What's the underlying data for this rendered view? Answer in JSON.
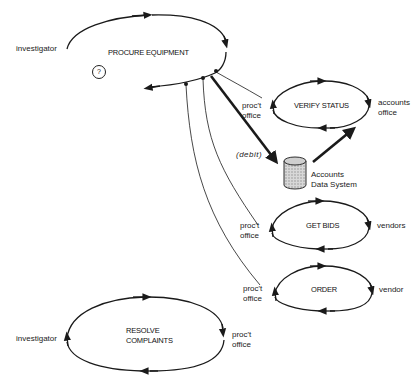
{
  "diagram": {
    "stroke_color": "#1a1a1a",
    "background": "#ffffff",
    "loops": [
      {
        "id": "procure",
        "title": "PROCURE EQUIPMENT",
        "left_role": "investigator",
        "right_role": ""
      },
      {
        "id": "verify",
        "title": "VERIFY STATUS",
        "left_role": "proc't\noffice",
        "right_role": "accounts\noffice"
      },
      {
        "id": "bids",
        "title": "GET BIDS",
        "left_role": "proc't\noffice",
        "right_role": "vendors"
      },
      {
        "id": "order",
        "title": "ORDER",
        "left_role": "proc't\noffice",
        "right_role": "vendor"
      },
      {
        "id": "resolve",
        "title": "RESOLVE\nCOMPLAINTS",
        "left_role": "investigator",
        "right_role": "proc't\noffice"
      }
    ],
    "procure": {
      "title": "PROCURE EQUIPMENT",
      "left_role": "investigator",
      "question_mark": "?"
    },
    "verify": {
      "title": "VERIFY STATUS",
      "left_role_1": "proc't",
      "left_role_2": "office",
      "right_role_1": "accounts",
      "right_role_2": "office"
    },
    "bids": {
      "title": "GET BIDS",
      "left_role_1": "proc't",
      "left_role_2": "office",
      "right_role": "vendors"
    },
    "order": {
      "title": "ORDER",
      "left_role_1": "proc't",
      "left_role_2": "office",
      "right_role": "vendor"
    },
    "resolve": {
      "title_1": "RESOLVE",
      "title_2": "COMPLAINTS",
      "left_role": "investigator",
      "right_role_1": "proc't",
      "right_role_2": "office"
    },
    "database": {
      "label_1": "Accounts",
      "label_2": "Data System",
      "icon": "database-cylinder-icon"
    },
    "debit_label": "(debit)"
  }
}
